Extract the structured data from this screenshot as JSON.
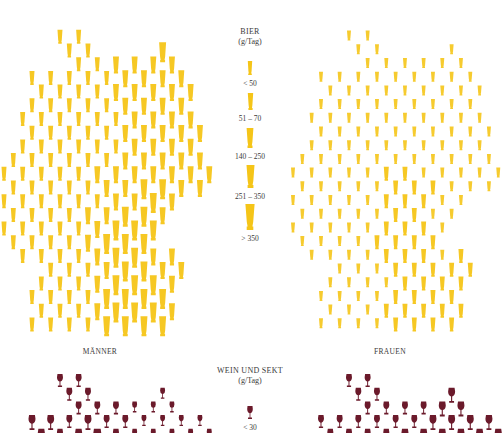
{
  "colors": {
    "beer": "#f5c518",
    "beer_light": "#fbe27a",
    "wine": "#6b1a2b",
    "text": "#3a3a3a"
  },
  "beer_section": {
    "title": "BIER",
    "unit": "(g/Tag)",
    "legend": [
      {
        "label": "< 50",
        "size": 1
      },
      {
        "label": "51 – 70",
        "size": 2
      },
      {
        "label": "140 – 250",
        "size": 3
      },
      {
        "label": "251 – 350",
        "size": 4
      },
      {
        "label": "> 350",
        "size": 5
      }
    ],
    "men_label": "MÄNNER",
    "women_label": "FRAUEN"
  },
  "wine_section": {
    "title": "WEIN UND SEKT",
    "unit": "(g/Tag)",
    "legend": [
      {
        "label": "< 30",
        "size": 1
      }
    ]
  },
  "chart_data": [
    {
      "type": "pictogram-map",
      "title": "BIER (g/Tag) – MÄNNER",
      "legend": [
        "< 50",
        "51 – 70",
        "140 – 250",
        "251 – 350",
        "> 350"
      ],
      "grid": {
        "x0": 4,
        "y0": 28,
        "dx": 9.33,
        "dy": 13.7
      },
      "rows": [
        "......2.2..............",
        ".......2.2.......4.....",
        "........2.2.3.3.3.3....",
        "...2.2.2.2.2.3.3.3.3...",
        "....2.2.2.2.3.3.3.3.3..",
        "...2.2.2.2.2.3.3.3.3...",
        "..2.2.2.2.2.2.3.3.3.3..",
        "...2.2.2.2.2.3.3.3.3.3.",
        "..2.2.2.2.2.2.3.3.3.3..",
        ".2.2.2.2.2.2.3.3.3.3.3.",
        "2.2.2.2.2.3.3.3.3.3.3.3",
        ".2.2.2.2.2.3.3.4.4.3.3.",
        "2.2.2.2.2.2.3.3.4.3....",
        ".2.2.2.2.3.3.4.4.3.....",
        "2.2.2.2.2.3.4.4.4......",
        ".2.2.2.2.3.4.4.4.......",
        "..2.2.2.2.3.4.4.3.3....",
        ".....2.2.2.3.4.4.3.3...",
        "....2.2.2.3.4.4.4.3....",
        "...2.2.2.2.4.4.4.4.....",
        "....2.2.2.3.4.4.4.3....",
        "...2.2.2.2.4.4.4.4....."
      ]
    },
    {
      "type": "pictogram-map",
      "title": "BIER (g/Tag) – FRAUEN",
      "legend": [
        "< 50",
        "51 – 70",
        "140 – 250",
        "251 – 350",
        "> 350"
      ],
      "grid": {
        "x0": 293,
        "y0": 28,
        "dx": 9.33,
        "dy": 13.7
      },
      "rows": [
        "......1.1..............",
        ".......1.1.......1.....",
        "........1.1.1.1.1.1....",
        "...1.1.1.1.1.1.1.1.1...",
        "....1.1.1.1.1.1.1.1.1..",
        "...1.1.1.1.1.1.1.1.1...",
        "..1.1.1.1.1.1.1.1.1.1..",
        "...1.1.1.1.1.1.1.1.1.1.",
        "..1.1.1.1.1.1.1.1.1.1..",
        ".1.1.1.1.1.1.1.1.1.1.1.",
        "1.1.1.1.1.2.2.1.1.1.1.1",
        ".1.1.1.1.1.2.2.2.1.1.1.",
        "1.1.1.1.1.2.2.2.1.1....",
        ".1.1.1.1.1.2.2.1.1.....",
        "1.1.1.1.1.2.2.2.1......",
        ".1.1.1.1.2.2.2.2.......",
        "..1.1.1.1.2.2.2.1.2....",
        ".....1.1.1.2.2.2.2.2...",
        "....1.1.1.1.2.2.2.2....",
        "...1.1.1.1.2.2.2.2.....",
        "....1.1.1.2.2.2.2.2....",
        "...1.1.1.1.2.2.2.2....."
      ]
    },
    {
      "type": "pictogram-map",
      "title": "WEIN UND SEKT (g/Tag) – MÄNNER",
      "legend": [
        "< 30"
      ],
      "grid": {
        "x0": 4,
        "y0": 374,
        "dx": 9.33,
        "dy": 13.7
      },
      "rows": [
        "......2.2..............",
        ".......2.2.......1.....",
        "........2.2.2.1.1.1....",
        "...3.3.2.3.2.2.1.1.1.1.",
        "....3.2.3.4.2.1.1.1.1.1"
      ]
    },
    {
      "type": "pictogram-map",
      "title": "WEIN UND SEKT (g/Tag) – FRAUEN",
      "legend": [
        "< 30"
      ],
      "grid": {
        "x0": 293,
        "y0": 374,
        "dx": 9.33,
        "dy": 13.7
      },
      "rows": [
        "......2.2..............",
        ".......2.2.......3.....",
        "........2.2.2.2.3.3....",
        "...2.2.2.2.2.2.3.3.3.3.",
        "....2.2.2.2.3.3.3.3.3.3"
      ]
    }
  ]
}
